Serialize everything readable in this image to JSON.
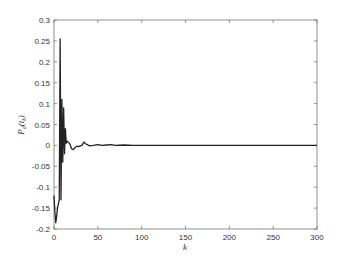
{
  "chart_data": {
    "type": "line",
    "title": "",
    "xlabel": "k",
    "ylabel": "P_d(t_k)",
    "ylabel_main": "P",
    "ylabel_sub": "d",
    "ylabel_arg": "(t",
    "ylabel_arg_sub": "k",
    "ylabel_close": ")",
    "xlim": [
      0,
      300
    ],
    "ylim": [
      -0.2,
      0.3
    ],
    "xticks": [
      0,
      50,
      100,
      150,
      200,
      250,
      300
    ],
    "yticks": [
      -0.2,
      -0.15,
      -0.1,
      -0.05,
      0,
      0.05,
      0.1,
      0.15,
      0.2,
      0.25,
      0.3
    ],
    "xtick_labels": [
      "0",
      "50",
      "100",
      "150",
      "200",
      "250",
      "300"
    ],
    "ytick_labels": [
      "-0.2",
      "-0.15",
      "-0.1",
      "-0.05",
      "0",
      "0.05",
      "0.1",
      "0.15",
      "0.2",
      "0.25",
      "0.3"
    ],
    "grid": false,
    "legend": null,
    "series": [
      {
        "name": "P_d(t_k)",
        "color": "#222222",
        "x": [
          0,
          1,
          2,
          3,
          4,
          5,
          6,
          7,
          8,
          9,
          10,
          11,
          12,
          13,
          14,
          15,
          16,
          17,
          18,
          20,
          22,
          24,
          26,
          28,
          30,
          32,
          34,
          36,
          38,
          40,
          45,
          50,
          55,
          60,
          65,
          70,
          80,
          90,
          100,
          150,
          200,
          250,
          300
        ],
        "values": [
          -0.12,
          -0.16,
          -0.185,
          -0.17,
          -0.15,
          -0.14,
          -0.13,
          0.255,
          -0.13,
          0.11,
          -0.04,
          0.09,
          -0.02,
          0.04,
          0.005,
          0.01,
          0.008,
          0.006,
          0.004,
          -0.008,
          -0.01,
          -0.005,
          -0.002,
          -0.003,
          -0.001,
          0.0,
          0.008,
          0.004,
          0.002,
          -0.001,
          0.0,
          0.002,
          0.0,
          0.001,
          0.002,
          0.0,
          0.001,
          0.0,
          0.0,
          0.0,
          0.0,
          0.0,
          0.0
        ]
      }
    ]
  }
}
